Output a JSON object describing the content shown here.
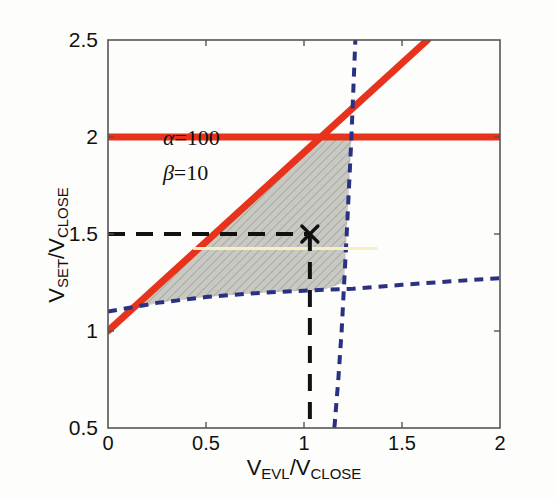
{
  "chart_data": {
    "type": "line",
    "title": "",
    "subtitle": "",
    "xlabel": "V_EVL/V_CLOSE",
    "ylabel": "V_SET/V_CLOSE",
    "xlabel_parts": {
      "main1": "V",
      "sub1": "EVL",
      "slash": "/V",
      "sub2": "CLOSE"
    },
    "ylabel_parts": {
      "main1": "V",
      "sub1": "SET",
      "slash": "/V",
      "sub2": "CLOSE"
    },
    "xlim": [
      0,
      2
    ],
    "ylim": [
      0.5,
      2.5
    ],
    "xticks": [
      0,
      0.5,
      1,
      1.5,
      2
    ],
    "xticklabels": [
      "0",
      "0.5",
      "1",
      "1.5",
      "2"
    ],
    "yticks": [
      0.5,
      1,
      1.5,
      2,
      2.5
    ],
    "yticklabels": [
      "0.5",
      "1",
      "1.5",
      "2",
      "2.5"
    ],
    "grid": false,
    "legend": "none",
    "colors": {
      "red": "#e8331c",
      "blue": "#2b3180",
      "black": "#111111",
      "shade_fill": "#c9c9c4",
      "shade_hatch": "#9a9a95",
      "yellow": "#f4f0c0",
      "axis": "#555555",
      "background": "#fdfdfb"
    },
    "annotations": [
      {
        "name": "alpha",
        "symbol": "α",
        "text": "=100",
        "x": 0.14,
        "y": 0.78
      },
      {
        "name": "beta",
        "symbol": "β",
        "text": "=10",
        "x": 0.14,
        "y": 0.69
      }
    ],
    "series": [
      {
        "name": "red-horizontal-limit",
        "style": "solid",
        "color": "#e8331c",
        "width": 7,
        "points": [
          [
            0,
            2.0
          ],
          [
            2.0,
            2.0
          ]
        ]
      },
      {
        "name": "red-diagonal-limit",
        "style": "solid",
        "color": "#e8331c",
        "width": 7,
        "points": [
          [
            0,
            1.0
          ],
          [
            1.63,
            2.5
          ]
        ]
      },
      {
        "name": "blue-lower-boundary",
        "style": "dashed",
        "color": "#2b3180",
        "width": 4,
        "points": [
          [
            0,
            1.1
          ],
          [
            0.25,
            1.145
          ],
          [
            0.5,
            1.175
          ],
          [
            0.75,
            1.195
          ],
          [
            1.0,
            1.208
          ],
          [
            1.1,
            1.212
          ],
          [
            1.25,
            1.218
          ],
          [
            1.5,
            1.238
          ],
          [
            1.75,
            1.256
          ],
          [
            2.0,
            1.272
          ]
        ]
      },
      {
        "name": "blue-steep-boundary",
        "style": "dashed",
        "color": "#2b3180",
        "width": 4,
        "points": [
          [
            1.155,
            0.5
          ],
          [
            1.175,
            0.75
          ],
          [
            1.192,
            1.0
          ],
          [
            1.205,
            1.25
          ],
          [
            1.218,
            1.5
          ],
          [
            1.23,
            1.75
          ],
          [
            1.242,
            2.0
          ],
          [
            1.252,
            2.25
          ],
          [
            1.262,
            2.5
          ]
        ]
      },
      {
        "name": "yellow-operating-line",
        "style": "solid",
        "color": "#f4f0c0",
        "width": 3,
        "points": [
          [
            0.44,
            1.425
          ],
          [
            1.37,
            1.425
          ]
        ]
      },
      {
        "name": "black-dashed-horizontal-guide",
        "style": "dashed",
        "color": "#111111",
        "width": 4,
        "points": [
          [
            0,
            1.5
          ],
          [
            1.03,
            1.5
          ]
        ]
      },
      {
        "name": "black-dashed-vertical-guide",
        "style": "dashed",
        "color": "#111111",
        "width": 4,
        "points": [
          [
            1.03,
            1.5
          ],
          [
            1.03,
            0.5
          ]
        ]
      }
    ],
    "markers": [
      {
        "name": "operating-point",
        "symbol": "x",
        "x": 1.03,
        "y": 1.5,
        "color": "#111111",
        "size": 16
      }
    ],
    "shaded_region": {
      "name": "feasible-design-window",
      "fill": "#c9c9c4",
      "hatch": "diagonal",
      "polygon": [
        [
          0.105,
          1.1
        ],
        [
          1.09,
          2.0
        ],
        [
          1.242,
          2.0
        ],
        [
          1.205,
          1.25
        ],
        [
          1.1,
          1.212
        ],
        [
          1.0,
          1.208
        ],
        [
          0.75,
          1.195
        ],
        [
          0.5,
          1.175
        ],
        [
          0.25,
          1.145
        ]
      ]
    }
  }
}
